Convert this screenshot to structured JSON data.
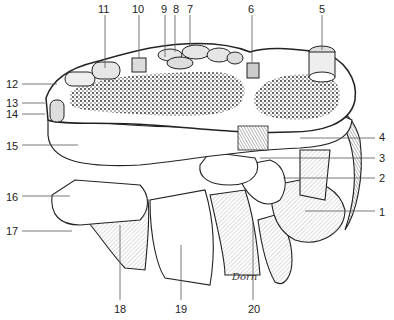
{
  "figure": {
    "signature": "Dorn",
    "colors": {
      "line": "#222222",
      "stipple": "#1a1a1a",
      "background": "#ffffff"
    },
    "labels": [
      {
        "id": "1",
        "text": "1",
        "x": 379,
        "y": 207,
        "lx1": 305,
        "ly1": 211,
        "lx2": 375,
        "ly2": 211
      },
      {
        "id": "2",
        "text": "2",
        "x": 379,
        "y": 173,
        "lx1": 283,
        "ly1": 178,
        "lx2": 375,
        "ly2": 178
      },
      {
        "id": "3",
        "text": "3",
        "x": 379,
        "y": 153,
        "lx1": 260,
        "ly1": 158,
        "lx2": 375,
        "ly2": 158
      },
      {
        "id": "4",
        "text": "4",
        "x": 379,
        "y": 132,
        "lx1": 300,
        "ly1": 138,
        "lx2": 375,
        "ly2": 138
      },
      {
        "id": "5",
        "text": "5",
        "x": 319,
        "y": 4,
        "lx1": 322,
        "ly1": 15,
        "lx2": 322,
        "ly2": 50
      },
      {
        "id": "6",
        "text": "6",
        "x": 248,
        "y": 4,
        "lx1": 252,
        "ly1": 15,
        "lx2": 252,
        "ly2": 62
      },
      {
        "id": "7",
        "text": "7",
        "x": 187,
        "y": 4,
        "lx1": 190,
        "ly1": 15,
        "lx2": 190,
        "ly2": 47
      },
      {
        "id": "8",
        "text": "8",
        "x": 173,
        "y": 4,
        "lx1": 175,
        "ly1": 15,
        "lx2": 175,
        "ly2": 52
      },
      {
        "id": "9",
        "text": "9",
        "x": 161,
        "y": 4,
        "lx1": 165,
        "ly1": 15,
        "lx2": 165,
        "ly2": 57
      },
      {
        "id": "10",
        "text": "10",
        "x": 132,
        "y": 4,
        "lx1": 139,
        "ly1": 15,
        "lx2": 139,
        "ly2": 58
      },
      {
        "id": "11",
        "text": "11",
        "x": 98,
        "y": 4,
        "lx1": 105,
        "ly1": 15,
        "lx2": 105,
        "ly2": 68
      },
      {
        "id": "12",
        "text": "12",
        "x": 6,
        "y": 79,
        "lx1": 22,
        "ly1": 84,
        "lx2": 57,
        "ly2": 84
      },
      {
        "id": "13",
        "text": "13",
        "x": 6,
        "y": 98,
        "lx1": 22,
        "ly1": 103,
        "lx2": 45,
        "ly2": 103
      },
      {
        "id": "14",
        "text": "14",
        "x": 6,
        "y": 109,
        "lx1": 22,
        "ly1": 114,
        "lx2": 45,
        "ly2": 114
      },
      {
        "id": "15",
        "text": "15",
        "x": 6,
        "y": 141,
        "lx1": 22,
        "ly1": 145,
        "lx2": 78,
        "ly2": 145
      },
      {
        "id": "16",
        "text": "16",
        "x": 6,
        "y": 192,
        "lx1": 22,
        "ly1": 196,
        "lx2": 70,
        "ly2": 196
      },
      {
        "id": "17",
        "text": "17",
        "x": 6,
        "y": 226,
        "lx1": 22,
        "ly1": 231,
        "lx2": 72,
        "ly2": 231
      },
      {
        "id": "18",
        "text": "18",
        "x": 114,
        "y": 304,
        "lx1": 120,
        "ly1": 225,
        "lx2": 120,
        "ly2": 300
      },
      {
        "id": "19",
        "text": "19",
        "x": 175,
        "y": 304,
        "lx1": 181,
        "ly1": 245,
        "lx2": 181,
        "ly2": 300
      },
      {
        "id": "20",
        "text": "20",
        "x": 248,
        "y": 304,
        "lx1": 253,
        "ly1": 222,
        "lx2": 253,
        "ly2": 300
      }
    ]
  }
}
